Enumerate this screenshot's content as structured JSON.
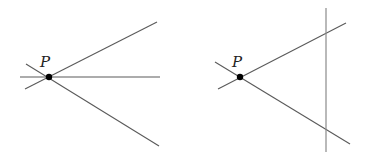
{
  "figures": [
    {
      "name": "left-figure",
      "point": {
        "label": "P",
        "x": 49,
        "y": 77,
        "r": 3.2,
        "label_x": 40,
        "label_y": 67
      },
      "lines": [
        {
          "name": "upper-ray",
          "x1": 25,
          "y1": 89,
          "x2": 157,
          "y2": 22
        },
        {
          "name": "horizontal-line",
          "x1": 20,
          "y1": 77,
          "x2": 160,
          "y2": 77
        },
        {
          "name": "lower-ray",
          "x1": 26,
          "y1": 64,
          "x2": 159,
          "y2": 146
        }
      ]
    },
    {
      "name": "right-figure",
      "point": {
        "label": "P",
        "x": 240,
        "y": 77,
        "r": 3.2,
        "label_x": 232,
        "label_y": 67
      },
      "lines": [
        {
          "name": "upper-ray",
          "x1": 218,
          "y1": 89,
          "x2": 346,
          "y2": 23
        },
        {
          "name": "lower-ray",
          "x1": 215,
          "y1": 62,
          "x2": 350,
          "y2": 144
        },
        {
          "name": "vertical-line",
          "x1": 326,
          "y1": 8,
          "x2": 326,
          "y2": 152
        }
      ]
    }
  ],
  "colors": {
    "line": "#5a5a5a",
    "vertical_line": "#8a8a8a",
    "point": "#000000"
  }
}
